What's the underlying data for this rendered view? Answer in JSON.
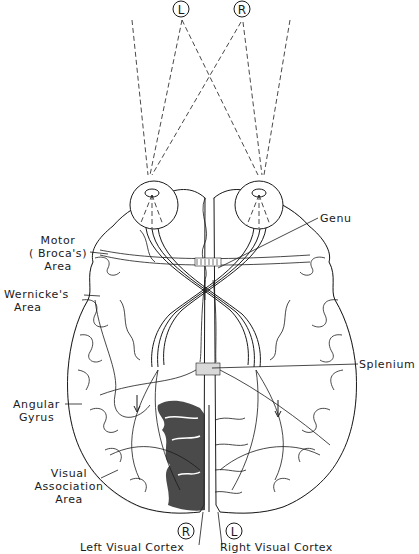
{
  "figure": {
    "type": "anatomical-diagram"
  },
  "visual_field_markers": [
    {
      "id": "left",
      "letter": "L"
    },
    {
      "id": "right",
      "letter": "R"
    }
  ],
  "cortex_markers": [
    {
      "id": "left-cortex-field",
      "letter": "R"
    },
    {
      "id": "right-cortex-field",
      "letter": "L"
    }
  ],
  "labels": {
    "motor": [
      "Motor",
      "( Broca's)",
      "Area"
    ],
    "wernicke": [
      "Wernicke's",
      "Area"
    ],
    "angular": [
      "Angular",
      "Gyrus"
    ],
    "visual_assoc": [
      "Visual",
      "Association",
      "Area"
    ],
    "genu": "Genu",
    "splenium": "Splenium",
    "left_visual_cortex": "Left Visual Cortex",
    "right_visual_cortex": "Right Visual Cortex"
  },
  "colors": {
    "ink": "#1a1a1a",
    "stipple": "#bdbdbd",
    "dark_cortex": "#2a2a2a",
    "background": "#ffffff"
  }
}
